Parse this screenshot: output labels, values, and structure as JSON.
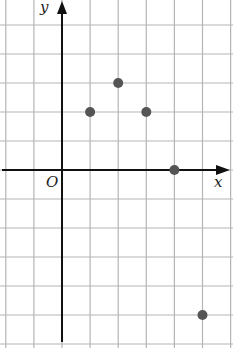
{
  "chart_data": {
    "type": "scatter",
    "title": "",
    "xlabel": "x",
    "ylabel": "y",
    "origin_label": "O",
    "grid": true,
    "xlim": [
      -2,
      6
    ],
    "ylim": [
      -6,
      5
    ],
    "points": [
      {
        "x": 1,
        "y": 2
      },
      {
        "x": 2,
        "y": 3
      },
      {
        "x": 3,
        "y": 2
      },
      {
        "x": 4,
        "y": 0
      },
      {
        "x": 5,
        "y": -5
      }
    ]
  },
  "colors": {
    "grid": "#b5b5b5",
    "axis": "#111111",
    "point": "#555555"
  }
}
